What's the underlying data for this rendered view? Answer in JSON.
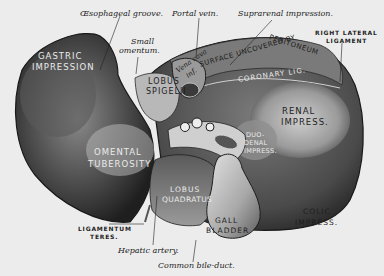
{
  "figure": {
    "colors": {
      "background": "#ececec",
      "liver_dark": "#2e2e2e",
      "liver_mid": "#6a6a6a",
      "liver_light": "#bdbdbd",
      "gallbladder": "#c9c9c9",
      "label_dark": "#1e1e1e",
      "label_light": "#eaeaea"
    }
  },
  "labels": {
    "outside": {
      "esophageal_groove": "Œsophageal groove.",
      "portal_vein": "Portal vein.",
      "suprarenal_impression": "Suprarenal impression.",
      "small_omentum_1": "Small",
      "small_omentum_2": "omentum.",
      "right_lateral_ligament_1": "RIGHT LATERAL",
      "right_lateral_ligament_2": "LIGAMENT",
      "ligamentum_teres_1": "LIGAMENTUM",
      "ligamentum_teres_2": "TERES.",
      "hepatic_artery": "Hepatic artery.",
      "common_bile_duct": "Common bile-duct."
    },
    "inside": {
      "gastric_impression_1": "GASTRIC",
      "gastric_impression_2": "IMPRESSION",
      "lobus_spigelii_1": "LOBUS",
      "lobus_spigelii_2": "SPIGELII",
      "vena_cava_1": "Vena cava",
      "vena_cava_2": "inf.",
      "surface_uncovered_1": "SURFACE UNCOVERED BY",
      "surface_uncovered_2": "PERITONEUM",
      "coronary_lig": "CORONARY LIG.",
      "renal_impress_1": "RENAL",
      "renal_impress_2": "IMPRESS.",
      "duodenal_impress_1": "DUO-",
      "duodenal_impress_2": "DENAL",
      "duodenal_impress_3": "IMPRESS.",
      "omental_tuberosity_1": "OMENTAL",
      "omental_tuberosity_2": "TUBEROSITY",
      "lobus_quadratus_1": "LOBUS",
      "lobus_quadratus_2": "QUADRATUS",
      "gall_bladder_1": "GALL",
      "gall_bladder_2": "BLADDER",
      "colic_impress_1": "COLIC",
      "colic_impress_2": "IMPRESS."
    }
  }
}
